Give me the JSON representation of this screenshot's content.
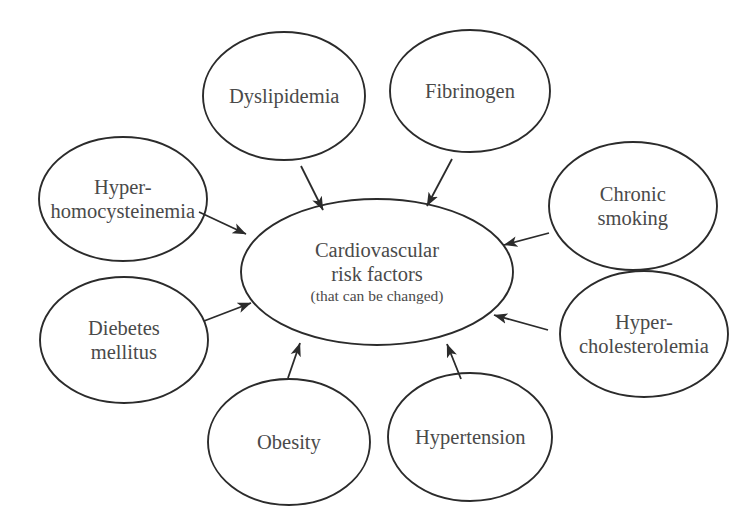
{
  "diagram": {
    "background_color": "#ffffff",
    "stroke_color": "#2b2b2b",
    "text_color": "#4a4a4a",
    "center": {
      "id": "cardiovascular-risk-factors",
      "line1": "Cardiovascular",
      "line2": "risk factors",
      "sub": "(that can be changed)"
    },
    "nodes": [
      {
        "id": "dyslipidemia",
        "line1": "Dyslipidemia",
        "line2": "",
        "cx": 284,
        "cy": 96,
        "rx": 81,
        "ry": 64,
        "label_x": 284,
        "label_y": 96
      },
      {
        "id": "fibrinogen",
        "line1": "Fibrinogen",
        "line2": "",
        "cx": 470,
        "cy": 91,
        "rx": 80,
        "ry": 61,
        "label_x": 470,
        "label_y": 91
      },
      {
        "id": "hyper-homocysteinemia",
        "line1": "Hyper-",
        "line2": "homocysteinemia",
        "cx": 123,
        "cy": 199,
        "rx": 84,
        "ry": 62,
        "label_x": 123,
        "label_y": 199
      },
      {
        "id": "chronic-smoking",
        "line1": "Chronic",
        "line2": "smoking",
        "cx": 633,
        "cy": 206,
        "rx": 84,
        "ry": 64,
        "label_x": 633,
        "label_y": 206
      },
      {
        "id": "diebetes-mellitus",
        "line1": "Diebetes",
        "line2": "mellitus",
        "cx": 124,
        "cy": 340,
        "rx": 84,
        "ry": 63,
        "label_x": 124,
        "label_y": 340
      },
      {
        "id": "hyper-cholesterolemia",
        "line1": "Hyper-",
        "line2": "cholesterolemia",
        "cx": 644,
        "cy": 334,
        "rx": 84,
        "ry": 63,
        "label_x": 644,
        "label_y": 334
      },
      {
        "id": "obesity",
        "line1": "Obesity",
        "line2": "",
        "cx": 289,
        "cy": 442,
        "rx": 81,
        "ry": 63,
        "label_x": 289,
        "label_y": 442
      },
      {
        "id": "hypertension",
        "line1": "Hypertension",
        "line2": "",
        "cx": 470,
        "cy": 437,
        "rx": 82,
        "ry": 64,
        "label_x": 470,
        "label_y": 437
      }
    ],
    "center_ellipse": {
      "cx": 377,
      "cy": 272,
      "rx": 136,
      "ry": 73
    },
    "arrows": [
      {
        "id": "arrow-dyslipidemia-to-center",
        "from": "dyslipidemia",
        "to": "cardiovascular-risk-factors",
        "x1": 301,
        "y1": 166,
        "x2": 323,
        "y2": 210
      },
      {
        "id": "arrow-fibrinogen-to-center",
        "from": "fibrinogen",
        "to": "cardiovascular-risk-factors",
        "x1": 452,
        "y1": 159,
        "x2": 427,
        "y2": 206
      },
      {
        "id": "arrow-hyper-homocysteinemia-to-center",
        "from": "hyper-homocysteinemia",
        "to": "cardiovascular-risk-factors",
        "x1": 199,
        "y1": 212,
        "x2": 246,
        "y2": 234
      },
      {
        "id": "arrow-chronic-smoking-to-center",
        "from": "chronic-smoking",
        "to": "cardiovascular-risk-factors",
        "x1": 549,
        "y1": 233,
        "x2": 504,
        "y2": 245
      },
      {
        "id": "arrow-diebetes-mellitus-to-center",
        "from": "diebetes-mellitus",
        "to": "cardiovascular-risk-factors",
        "x1": 204,
        "y1": 321,
        "x2": 251,
        "y2": 303
      },
      {
        "id": "arrow-hyper-cholesterolemia-to-center",
        "from": "hyper-cholesterolemia",
        "to": "cardiovascular-risk-factors",
        "x1": 548,
        "y1": 330,
        "x2": 494,
        "y2": 315
      },
      {
        "id": "arrow-obesity-to-center",
        "from": "obesity",
        "to": "cardiovascular-risk-factors",
        "x1": 288,
        "y1": 378,
        "x2": 300,
        "y2": 343
      },
      {
        "id": "arrow-hypertension-to-center",
        "from": "hypertension",
        "to": "cardiovascular-risk-factors",
        "x1": 461,
        "y1": 379,
        "x2": 447,
        "y2": 344
      }
    ]
  }
}
